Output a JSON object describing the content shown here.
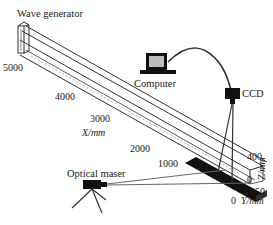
{
  "diagram": {
    "type": "experimental-setup",
    "components": {
      "wave_generator": {
        "label": "Wave generator"
      },
      "computer": {
        "label": "Computer"
      },
      "ccd": {
        "label": "CCD"
      },
      "optical_maser": {
        "label": "Optical maser"
      }
    },
    "axes": {
      "x": {
        "label": "X/mm",
        "ticks": [
          "5000",
          "4000",
          "3000",
          "2000",
          "1000"
        ]
      },
      "z": {
        "label": "Z/mm",
        "ticks": [
          "400",
          "0"
        ]
      },
      "y": {
        "label": "Y/mm",
        "ticks": [
          "150",
          "0"
        ]
      }
    },
    "colors": {
      "line": "#333333",
      "fill_dark": "#111111",
      "screen": "#bdbdbd",
      "background": "#ffffff"
    }
  }
}
